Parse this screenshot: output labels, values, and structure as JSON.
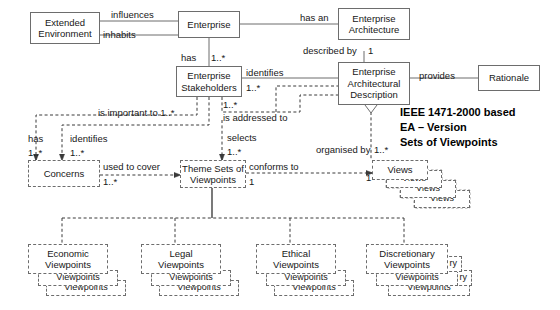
{
  "diagram": {
    "title_note": {
      "line1": "IEEE 1471-2000 based",
      "line2": "EA – Version",
      "line3": "Sets of Viewpoints"
    },
    "nodes": {
      "extended_environment": {
        "l1": "Extended",
        "l2": "Environment"
      },
      "enterprise": {
        "l1": "Enterprise"
      },
      "enterprise_architecture": {
        "l1": "Enterprise",
        "l2": "Architecture"
      },
      "enterprise_architectural_description": {
        "l1": "Enterprise",
        "l2": "Architectural",
        "l3": "Description"
      },
      "rationale": {
        "l1": "Rationale"
      },
      "enterprise_stakeholders": {
        "l1": "Enterprise",
        "l2": "Stakeholders"
      },
      "concerns": {
        "l1": "Concerns"
      },
      "theme_sets_of_viewpoints": {
        "l1": "Theme Sets of",
        "l2": "Viewpoints"
      },
      "views": {
        "l1": "Views"
      },
      "views_stack_2": {
        "l1": "Views"
      },
      "views_stack_3": {
        "l1": "Views"
      },
      "views_stack_4": {
        "l1": "Views"
      },
      "economic_viewpoints": {
        "l1": "Economic",
        "l2": "Viewpoints"
      },
      "economic_viewpoints_2": {
        "l1": "Viewpoints"
      },
      "economic_viewpoints_3": {
        "l1": "Viewpoints"
      },
      "legal_viewpoints": {
        "l1": "Legal",
        "l2": "Viewpoints"
      },
      "legal_viewpoints_2": {
        "l1": "Viewpoints"
      },
      "legal_viewpoints_3": {
        "l1": "Viewpoints"
      },
      "ethical_viewpoints": {
        "l1": "Ethical",
        "l2": "Viewpoints"
      },
      "ethical_viewpoints_2": {
        "l1": "Viewpoints"
      },
      "ethical_viewpoints_3": {
        "l1": "Viewpoints"
      },
      "discretionary_viewpoints": {
        "l1": "Discretionary",
        "l2": "Viewpoints"
      },
      "discretionary_viewpoints_2": {
        "l1": "Viewpoints"
      },
      "discretionary_viewpoints_3": {
        "l1": "Viewpoints"
      },
      "discretionary_shadow_a": {
        "l1": "ry"
      },
      "discretionary_shadow_b": {
        "l1": "ry"
      }
    },
    "edge_labels": {
      "influences": "influences",
      "inhabits": "inhabits",
      "has_an": "has an",
      "described_by": "described by",
      "described_by_mult": "1",
      "provides": "provides",
      "has": "has",
      "has_mult": "1..*",
      "identifies": "identifies",
      "identifies_mult": "1..*",
      "is_addressed_to": "is addressed to",
      "is_addressed_to_mult": "1..*",
      "is_important_to": "is important to 1..*",
      "concerns_has": "has",
      "concerns_has_mult": "1..*",
      "concerns_identifies": "identifies",
      "concerns_identifies_mult": "1..*",
      "used_to_cover": "used to cover",
      "used_to_cover_mult": "1..*",
      "selects": "selects",
      "selects_mult": "1..*",
      "conforms_to": "conforms to",
      "conforms_to_mult": "1",
      "organised_by": "organised by",
      "organised_by_mult": "1..*",
      "views_mult": "1"
    },
    "colors": {
      "stroke": "#6d6d6d",
      "text": "#171717",
      "background": "#ffffff",
      "solid_connector": "#6d6d6d"
    }
  }
}
